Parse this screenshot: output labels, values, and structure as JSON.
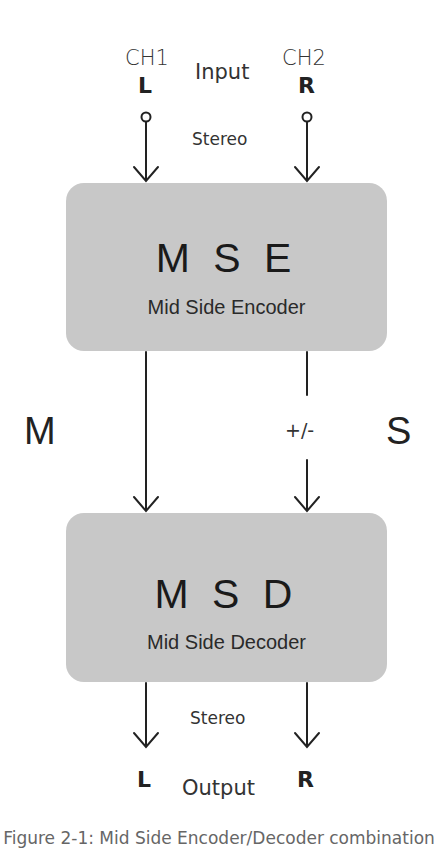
{
  "input": {
    "ch1_label": "CH1",
    "ch2_label": "CH2",
    "left_label": "L",
    "right_label": "R",
    "title": "Input",
    "mode": "Stereo"
  },
  "encoder": {
    "title": "M S E",
    "subtitle": "Mid Side Encoder"
  },
  "signals": {
    "mid_label": "M",
    "side_label": "S",
    "side_polarity": "+/-"
  },
  "decoder": {
    "title": "M S D",
    "subtitle": "Mid Side Decoder"
  },
  "output": {
    "mode": "Stereo",
    "left_label": "L",
    "right_label": "R",
    "title": "Output"
  },
  "caption": "Figure 2-1: Mid Side Encoder/Decoder combination",
  "colors": {
    "box_fill": "#c8c8c8",
    "line": "#222222",
    "background": "#ffffff"
  }
}
